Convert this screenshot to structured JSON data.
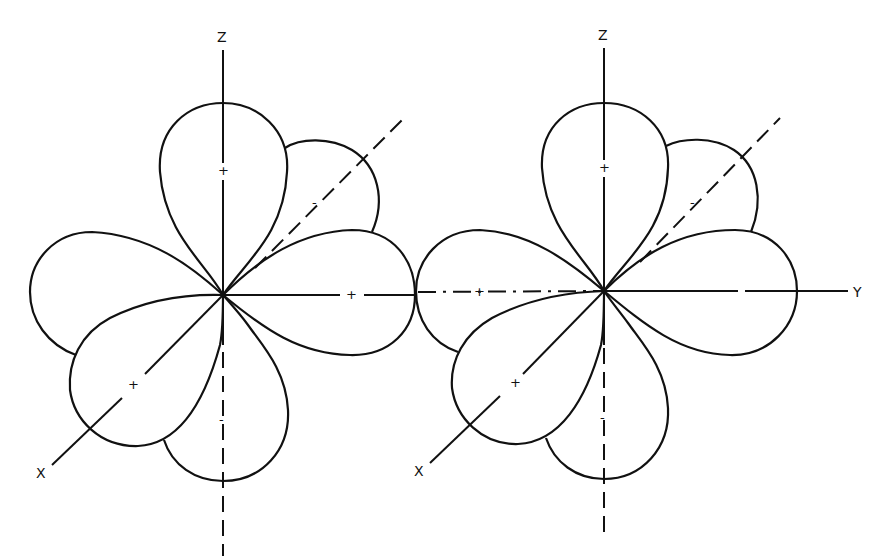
{
  "figure": {
    "diagrams": [
      {
        "id": "left",
        "axes": {
          "z": "Z",
          "x": "X"
        },
        "signs": {
          "top_lobe": "+",
          "back_diag_lobe": "-",
          "right_lobe": "+",
          "front_x_lobe": "+",
          "bottom_lobe": "-"
        }
      },
      {
        "id": "right",
        "axes": {
          "z": "Z",
          "x": "X",
          "y": "Y"
        },
        "signs": {
          "top_lobe": "+",
          "back_diag_lobe": "-",
          "left_lobe_axis": "+",
          "front_x_lobe": "+",
          "bottom_lobe": "-"
        }
      }
    ],
    "colors": {
      "stroke": "#111111",
      "background": "#ffffff"
    }
  }
}
